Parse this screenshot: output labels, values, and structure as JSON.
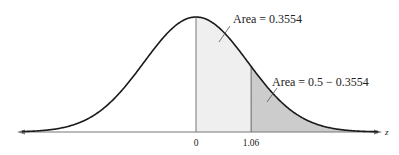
{
  "chart_data": {
    "type": "area",
    "title": "",
    "xlabel": "z",
    "ylabel": "",
    "x_ticks": [
      {
        "value": 0,
        "label": "0"
      },
      {
        "value": 1.06,
        "label": "1.06"
      }
    ],
    "regions": [
      {
        "name": "area-0-to-1.06",
        "from": 0,
        "to": 1.06,
        "label": "Area = 0.3554",
        "value": 0.3554,
        "fill": "#efefef"
      },
      {
        "name": "area-right-tail",
        "from": 1.06,
        "to": "inf",
        "label": "Area = 0.5 − 0.3554",
        "value": 0.1446,
        "fill": "#cccccc"
      }
    ],
    "grid": false,
    "legend": "none",
    "curve": {
      "mean": 0,
      "sd": 1
    },
    "colors": {
      "curve": "#1a1a1a",
      "axis": "#666666",
      "light_fill": "#efefef",
      "dark_fill": "#cccccc"
    }
  },
  "labels": {
    "area_center": "Area = 0.3554",
    "area_tail": "Area = 0.5 − 0.3554",
    "tick_zero": "0",
    "tick_z": "1.06",
    "axis_var": "z"
  }
}
